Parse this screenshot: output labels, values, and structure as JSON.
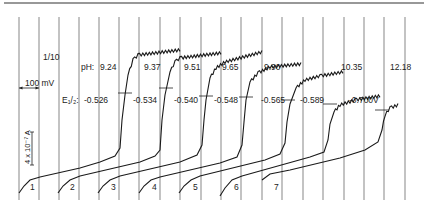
{
  "chart_data": {
    "type": "line",
    "title": "",
    "xlabel": "",
    "ylabel": "",
    "grid": true,
    "scale_bars": {
      "voltage": "100 mV",
      "current": "4 x 10⁻⁷ A",
      "sensitivity": "1/10"
    },
    "row_labels": {
      "ph": "pH:",
      "e_half": "E₁/₂:"
    },
    "curve_labels": [
      "1",
      "2",
      "3",
      "4",
      "5",
      "6",
      "7"
    ],
    "series": [
      {
        "name": "1",
        "ph": "9.24",
        "e_half": "-0.526"
      },
      {
        "name": "2",
        "ph": "9.37",
        "e_half": "-0.534"
      },
      {
        "name": "3",
        "ph": "9.51",
        "e_half": "-0.540"
      },
      {
        "name": "4",
        "ph": "9.65",
        "e_half": "-0.548"
      },
      {
        "name": "5",
        "ph": "9.90",
        "e_half": "-0.565"
      },
      {
        "name": "6",
        "ph": "10.35",
        "e_half": "-0.589"
      },
      {
        "name": "7",
        "ph": "12.18",
        "e_half": "-0.700V"
      }
    ],
    "grid_x": [
      19,
      39,
      59,
      79,
      99,
      119,
      139,
      160,
      180,
      201,
      221,
      241,
      262,
      282,
      303,
      323,
      344,
      364,
      384,
      405
    ],
    "curves_px": [
      {
        "label_xy": [
          30,
          190
        ],
        "base": [
          [
            19,
            193
          ],
          [
            24,
            186
          ],
          [
            30,
            180
          ],
          [
            40,
            177
          ],
          [
            80,
            168
          ],
          [
            100,
            162
          ],
          [
            115,
            156
          ],
          [
            120,
            148
          ],
          [
            122,
            120
          ],
          [
            125,
            95
          ],
          [
            128,
            75
          ],
          [
            133,
            60
          ],
          [
            138,
            55
          ],
          [
            180,
            50
          ]
        ],
        "half": [
          125,
          93
        ]
      },
      {
        "label_xy": [
          70,
          190
        ],
        "base": [
          [
            58,
            193
          ],
          [
            63,
            186
          ],
          [
            70,
            180
          ],
          [
            80,
            176
          ],
          [
            140,
            162
          ],
          [
            155,
            156
          ],
          [
            160,
            150
          ],
          [
            162,
            120
          ],
          [
            165,
            95
          ],
          [
            170,
            72
          ],
          [
            175,
            62
          ],
          [
            180,
            58
          ],
          [
            221,
            53
          ]
        ],
        "half": [
          166,
          88
        ]
      },
      {
        "label_xy": [
          111,
          190
        ],
        "base": [
          [
            98,
            193
          ],
          [
            103,
            186
          ],
          [
            110,
            180
          ],
          [
            120,
            176
          ],
          [
            180,
            162
          ],
          [
            197,
            155
          ],
          [
            202,
            145
          ],
          [
            204,
            120
          ],
          [
            206,
            100
          ],
          [
            210,
            78
          ],
          [
            216,
            68
          ],
          [
            225,
            62
          ],
          [
            262,
            52
          ]
        ],
        "half": [
          206,
          96
        ]
      },
      {
        "label_xy": [
          152,
          190
        ],
        "base": [
          [
            139,
            193
          ],
          [
            144,
            186
          ],
          [
            151,
            180
          ],
          [
            160,
            177
          ],
          [
            220,
            163
          ],
          [
            237,
            157
          ],
          [
            242,
            145
          ],
          [
            244,
            122
          ],
          [
            246,
            100
          ],
          [
            250,
            82
          ],
          [
            258,
            73
          ],
          [
            270,
            67
          ],
          [
            301,
            64
          ]
        ],
        "half": [
          246,
          97
        ]
      },
      {
        "label_xy": [
          193,
          190
        ],
        "base": [
          [
            179,
            193
          ],
          [
            184,
            186
          ],
          [
            191,
            180
          ],
          [
            200,
            176
          ],
          [
            265,
            160
          ],
          [
            280,
            154
          ],
          [
            285,
            143
          ],
          [
            287,
            122
          ],
          [
            290,
            104
          ],
          [
            296,
            88
          ],
          [
            305,
            80
          ],
          [
            320,
            76
          ],
          [
            343,
            72
          ]
        ],
        "half": [
          288,
          100
        ]
      },
      {
        "label_xy": [
          234,
          190
        ],
        "base": [
          [
            220,
            196
          ],
          [
            225,
            188
          ],
          [
            232,
            180
          ],
          [
            242,
            176
          ],
          [
            310,
            157
          ],
          [
            324,
            152
          ],
          [
            328,
            140
          ],
          [
            330,
            124
          ],
          [
            334,
            112
          ],
          [
            340,
            105
          ],
          [
            355,
            100
          ],
          [
            380,
            96
          ]
        ],
        "half": [
          330,
          104
        ]
      },
      {
        "label_xy": [
          274,
          190
        ],
        "base": [
          [
            262,
            180
          ],
          [
            270,
            174
          ],
          [
            290,
            170
          ],
          [
            340,
            158
          ],
          [
            365,
            150
          ],
          [
            378,
            142
          ],
          [
            382,
            130
          ],
          [
            385,
            115
          ],
          [
            390,
            108
          ],
          [
            398,
            105
          ]
        ],
        "half": [
          382,
          110
        ]
      }
    ]
  }
}
